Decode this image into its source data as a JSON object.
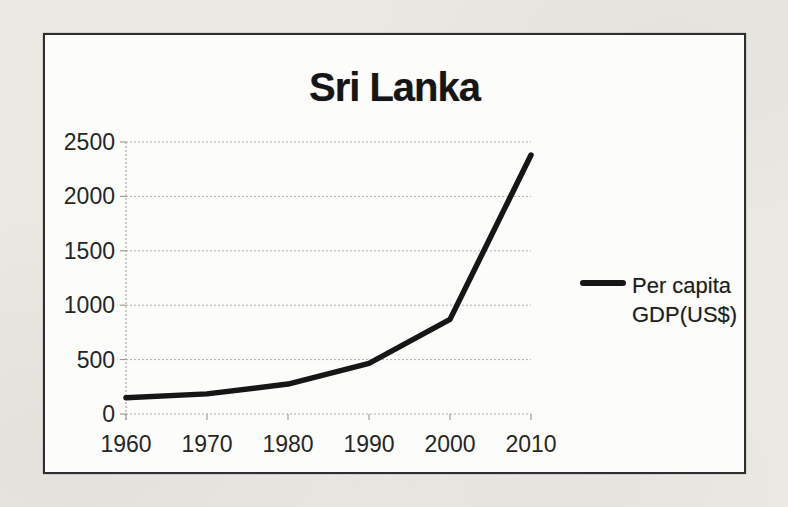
{
  "page": {
    "background_color": "#eae8e3",
    "paper_color": "#fcfcfa"
  },
  "chart_data": {
    "type": "line",
    "title": "Sri Lanka",
    "categories": [
      "1960",
      "1970",
      "1980",
      "1990",
      "2000",
      "2010"
    ],
    "series": [
      {
        "name": "Per capita GDP(US$)",
        "values": [
          150,
          185,
          275,
          465,
          870,
          2380
        ],
        "color": "#161616"
      }
    ],
    "xlabel": "",
    "ylabel": "",
    "ylim": [
      0,
      2500
    ],
    "yticks": [
      0,
      500,
      1000,
      1500,
      2000,
      2500
    ],
    "grid": true,
    "gridline_color": "#b3b1ac",
    "axis_text_color": "#262626",
    "legend_position": "right"
  }
}
